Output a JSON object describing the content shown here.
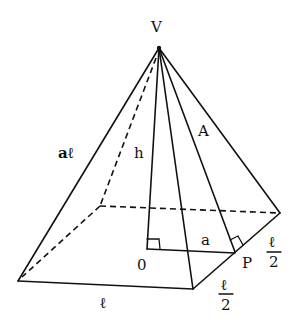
{
  "diagram": {
    "title": "",
    "type": "square pyramid",
    "labels": {
      "apex": "V",
      "slant_edge": "aℓ",
      "height": "h",
      "apothem": "A",
      "inradius": "a",
      "center": "0",
      "midpoint": "P",
      "base_side": "ℓ",
      "half_side_front": "ℓ/2",
      "half_side_front_num": "ℓ",
      "half_side_front_den": "2",
      "half_side_back_num": "ℓ",
      "half_side_back_den": "2"
    }
  }
}
